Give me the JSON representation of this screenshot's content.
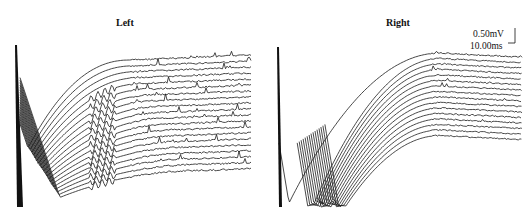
{
  "chart_data": [
    {
      "type": "line",
      "title": "Left",
      "n_traces": 20,
      "trace_spacing_px": 5.8,
      "description": "Stacked evoked-response sweeps after stimulus artifact; artifact at start, recovery curve, then flat baseline with spikes",
      "grid": false
    },
    {
      "type": "line",
      "title": "Right",
      "n_traces": 16,
      "trace_spacing_px": 5.5,
      "description": "Stacked evoked-response sweeps after stimulus artifact; deeper undershoot, recovery curve, then baseline",
      "grid": false
    }
  ],
  "panels": {
    "left": {
      "title": "Left"
    },
    "right": {
      "title": "Right"
    }
  },
  "scale_bar": {
    "voltage": "0.50mV",
    "time": "10.00ms"
  },
  "colors": {
    "trace": "#1a1a1a",
    "background": "#ffffff"
  }
}
